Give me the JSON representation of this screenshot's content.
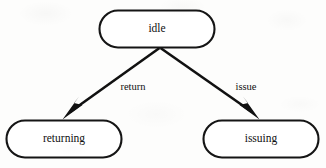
{
  "figure": {
    "caption": "Fig. 3.3 State transition diagram for C",
    "background_color": "#fdfdfc",
    "ink_color": "#111111"
  },
  "diagram_data": {
    "type": "state-transition-diagram",
    "nodes": [
      {
        "id": "idle",
        "label": "idle",
        "shape": "rounded-rectangle",
        "x": 157,
        "y": 29,
        "width": 116,
        "height": 38
      },
      {
        "id": "returning",
        "label": "returning",
        "shape": "rounded-rectangle",
        "x": 64,
        "y": 139,
        "width": 116,
        "height": 38
      },
      {
        "id": "issuing",
        "label": "issuing",
        "shape": "rounded-rectangle",
        "x": 261,
        "y": 139,
        "width": 116,
        "height": 38
      }
    ],
    "edges": [
      {
        "id": "return",
        "label": "return",
        "from": "idle",
        "to": "returning",
        "arrowhead": "solid-filled",
        "label_x": 133,
        "label_y": 88
      },
      {
        "id": "issue",
        "label": "issue",
        "from": "idle",
        "to": "issuing",
        "arrowhead": "solid-filled",
        "label_x": 246,
        "label_y": 88
      }
    ]
  }
}
